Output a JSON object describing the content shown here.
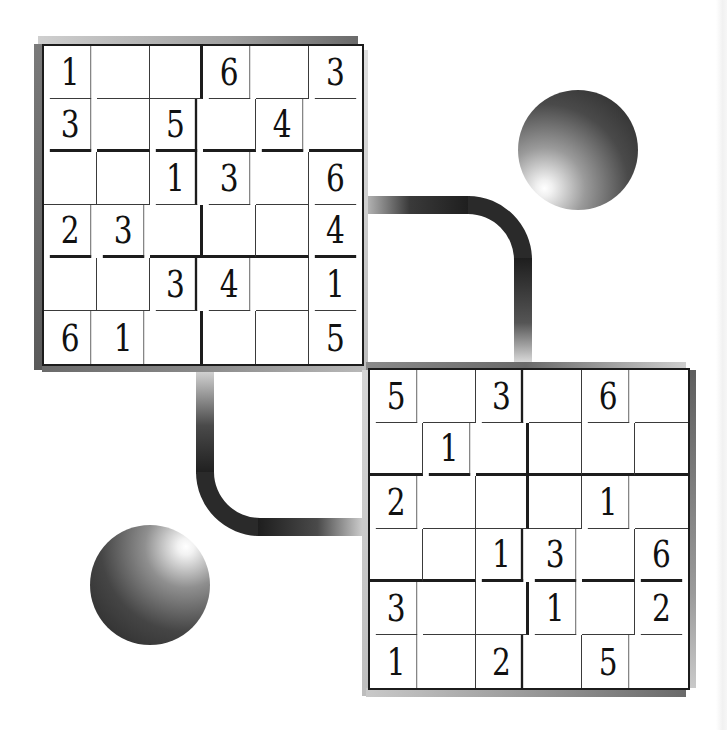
{
  "puzzles": [
    {
      "id": "top-left",
      "size": 6,
      "box_rows": 2,
      "box_cols": 3,
      "rows": [
        [
          "1",
          "",
          "",
          "6",
          "",
          "3"
        ],
        [
          "3",
          "",
          "5",
          "",
          "4",
          ""
        ],
        [
          "",
          "",
          "1",
          "3",
          "",
          "6"
        ],
        [
          "2",
          "3",
          "",
          "",
          "",
          "4"
        ],
        [
          "",
          "",
          "3",
          "4",
          "",
          "1"
        ],
        [
          "6",
          "1",
          "",
          "",
          "",
          "5"
        ]
      ]
    },
    {
      "id": "bottom-right",
      "size": 6,
      "box_rows": 2,
      "box_cols": 3,
      "rows": [
        [
          "5",
          "",
          "3",
          "",
          "6",
          ""
        ],
        [
          "",
          "1",
          "",
          "",
          "",
          ""
        ],
        [
          "2",
          "",
          "",
          "",
          "1",
          ""
        ],
        [
          "",
          "",
          "1",
          "3",
          "",
          "6"
        ],
        [
          "3",
          "",
          "",
          "1",
          "",
          "2"
        ],
        [
          "1",
          "",
          "2",
          "",
          "5",
          ""
        ]
      ]
    }
  ],
  "decorations": {
    "connectors": [
      "top-right-curved-pipe",
      "bottom-left-curved-pipe"
    ],
    "spheres": [
      "top-right-sphere",
      "bottom-left-sphere"
    ]
  },
  "colors": {
    "background": "#ffffff",
    "grid_line": "#1c1c1c",
    "digit": "#111111",
    "pipe_dark": "#2a2a2a"
  }
}
